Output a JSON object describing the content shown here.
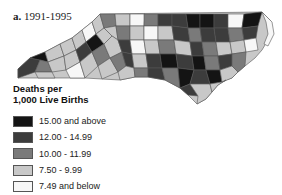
{
  "title": {
    "letter": "a.",
    "period": "1991-1995"
  },
  "legend": {
    "title_line1": "Deaths per",
    "title_line2": "1,000 Live Births",
    "items": [
      {
        "label": "15.00 and above",
        "color": "#141414"
      },
      {
        "label": "12.00 - 14.99",
        "color": "#3c3c3c"
      },
      {
        "label": "10.00 - 11.99",
        "color": "#7a7a7a"
      },
      {
        "label": "7.50 - 9.99",
        "color": "#c8c8c8"
      },
      {
        "label": "7.49 and below",
        "color": "#f7f7f7"
      }
    ]
  },
  "map": {
    "region": "North Carolina",
    "unit": "counties"
  }
}
